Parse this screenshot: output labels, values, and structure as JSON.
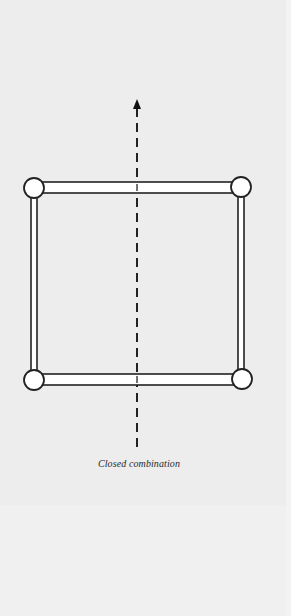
{
  "figure": {
    "caption": "Closed combination",
    "colors": {
      "background": "#ededed",
      "stroke": "#222222",
      "fill": "#ffffff"
    },
    "axis": {
      "type": "dashed-arrow",
      "direction": "up",
      "x": 137,
      "y_top": 99,
      "y_bottom": 450
    },
    "frame": {
      "shape": "rectangle",
      "members": [
        "top-bar",
        "bottom-bar",
        "left-bar",
        "right-bar"
      ],
      "joints": [
        {
          "name": "top-left",
          "cx": 34,
          "cy": 188
        },
        {
          "name": "top-right",
          "cx": 241,
          "cy": 187
        },
        {
          "name": "bottom-left",
          "cx": 34,
          "cy": 380
        },
        {
          "name": "bottom-right",
          "cx": 242,
          "cy": 379
        }
      ]
    }
  }
}
